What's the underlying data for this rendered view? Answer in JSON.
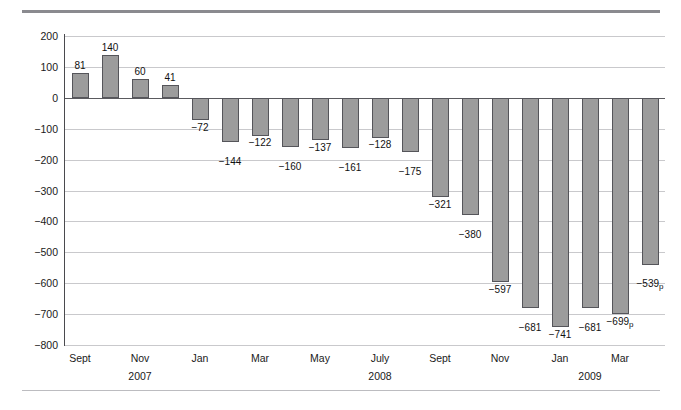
{
  "chart_data": {
    "type": "bar",
    "title": "",
    "xlabel": "",
    "ylabel": "Hundred thousands",
    "ylim": [
      -800,
      200
    ],
    "ytick_step": 100,
    "yticks": [
      "200",
      "100",
      "0",
      "−100",
      "−200",
      "−300",
      "−400",
      "−500",
      "−600",
      "−700",
      "−800"
    ],
    "grid": true,
    "legend": "none",
    "bar_color": "#9c9c9c",
    "bar_edge_color": "#55555a",
    "categories": [
      "Sept 2007",
      "Oct 2007",
      "Nov 2007",
      "Dec 2007",
      "Jan 2008",
      "Feb 2008",
      "Mar 2008",
      "Apr 2008",
      "May 2008",
      "June 2008",
      "July 2008",
      "Aug 2008",
      "Sept 2008",
      "Oct 2008",
      "Nov 2008",
      "Dec 2008",
      "Jan 2009",
      "Feb 2009",
      "Mar 2009",
      "Apr 2009"
    ],
    "values": [
      81,
      140,
      60,
      41,
      -72,
      -144,
      -122,
      -160,
      -137,
      -161,
      -128,
      -175,
      -321,
      -380,
      -597,
      -681,
      -741,
      -681,
      -699,
      -539
    ],
    "data_labels": [
      "81",
      "140",
      "60",
      "41",
      "−72",
      "−144",
      "−122",
      "−160",
      "−137",
      "−161",
      "−128",
      "−175",
      "−321",
      "−380",
      "−597",
      "−681",
      "−741",
      "−681",
      "−699",
      "−539"
    ],
    "data_label_suffix": [
      "",
      "",
      "",
      "",
      "",
      "",
      "",
      "",
      "",
      "",
      "",
      "",
      "",
      "",
      "",
      "",
      "",
      "",
      "p",
      "p"
    ],
    "xticks": [
      {
        "label": "Sept",
        "index": 0
      },
      {
        "label": "Nov",
        "index": 2
      },
      {
        "label": "Jan",
        "index": 4
      },
      {
        "label": "Mar",
        "index": 6
      },
      {
        "label": "May",
        "index": 8
      },
      {
        "label": "July",
        "index": 10
      },
      {
        "label": "Sept",
        "index": 12
      },
      {
        "label": "Nov",
        "index": 14
      },
      {
        "label": "Jan",
        "index": 16
      },
      {
        "label": "Mar",
        "index": 18
      }
    ],
    "year_groups": [
      {
        "label": "2007",
        "center_index": 2
      },
      {
        "label": "2008",
        "center_index": 10
      },
      {
        "label": "2009",
        "center_index": 17
      }
    ]
  }
}
